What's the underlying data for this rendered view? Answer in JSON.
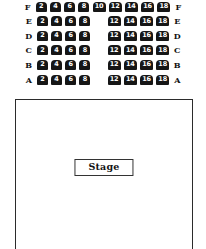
{
  "chart_data": {
    "type": "table",
    "layout": "even-numbered seats, rows A-F front-to-back, stage at front",
    "rows": [
      {
        "label": "F",
        "left_label": "F",
        "right_label": "F",
        "has_aisle": false,
        "left_section": [
          2,
          4,
          6,
          8,
          10
        ],
        "right_section": [
          12,
          14,
          16,
          18
        ],
        "seat_count": 9
      },
      {
        "label": "E",
        "left_label": "E",
        "right_label": "E",
        "has_aisle": true,
        "left_section": [
          2,
          4,
          6,
          8
        ],
        "right_section": [
          12,
          14,
          16,
          18
        ],
        "seat_count": 8
      },
      {
        "label": "D",
        "left_label": "D",
        "right_label": "D",
        "has_aisle": true,
        "left_section": [
          2,
          4,
          6,
          8
        ],
        "right_section": [
          12,
          14,
          16,
          18
        ],
        "seat_count": 8
      },
      {
        "label": "C",
        "left_label": "C",
        "right_label": "C",
        "has_aisle": true,
        "left_section": [
          2,
          4,
          6,
          8
        ],
        "right_section": [
          12,
          14,
          16,
          18
        ],
        "seat_count": 8
      },
      {
        "label": "B",
        "left_label": "B",
        "right_label": "B",
        "has_aisle": true,
        "left_section": [
          2,
          4,
          6,
          8
        ],
        "right_section": [
          12,
          14,
          16,
          18
        ],
        "seat_count": 8
      },
      {
        "label": "A",
        "left_label": "A",
        "right_label": "A",
        "has_aisle": true,
        "left_section": [
          2,
          4,
          6,
          8
        ],
        "right_section": [
          12,
          14,
          16,
          18
        ],
        "seat_count": 8
      }
    ],
    "total_seats": 49,
    "colors": {
      "seat_fill": "#161616",
      "seat_text": "#ffffff",
      "label_text": "#111111",
      "hall_border": "#2b2b2b",
      "background": "#ffffff"
    }
  },
  "stage": {
    "label": "Stage"
  }
}
